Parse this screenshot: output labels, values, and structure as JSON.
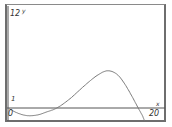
{
  "chart_data": {
    "type": "line",
    "title": "",
    "xlabel": "x",
    "ylabel": "y",
    "x_tick_labels": [
      "0",
      "20"
    ],
    "y_tick_labels": [
      "1",
      "12"
    ],
    "xlim": [
      0,
      20
    ],
    "ylim": [
      -1.7,
      12
    ],
    "grid": false,
    "legend": null,
    "series": [
      {
        "name": "f(x)",
        "x": [
          0,
          1,
          2,
          2.9,
          4,
          5,
          6.3,
          8,
          10,
          11.5,
          12.8,
          14,
          15,
          16,
          16.8,
          17.3,
          17.6
        ],
        "y": [
          0,
          -0.55,
          -0.9,
          -1.0,
          -0.85,
          -0.5,
          0,
          1.2,
          3.0,
          4.2,
          4.8,
          4.4,
          3.2,
          1.5,
          0,
          -0.9,
          -1.6
        ]
      }
    ],
    "colors": {
      "curve": "#7a7a7a",
      "axis": "#555555",
      "frame": "#6e6e6e",
      "text": "#333333"
    }
  },
  "labels": {
    "y_top": "12",
    "y_name": "y",
    "y_one": "1",
    "x_zero": "0",
    "x_name": "x",
    "x_max": "20"
  }
}
